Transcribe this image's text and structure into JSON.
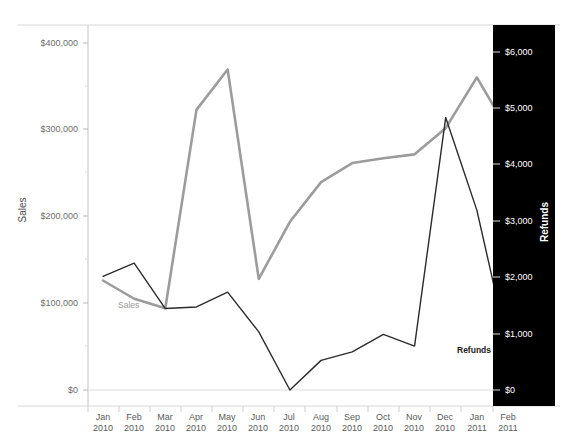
{
  "chart_data": {
    "type": "line",
    "title": "",
    "xlabel": "",
    "grid": false,
    "legend_position": "inline-annotations",
    "categories": [
      "Jan 2010",
      "Feb 2010",
      "Mar 2010",
      "Apr 2010",
      "May 2010",
      "Jun 2010",
      "Jul 2010",
      "Aug 2010",
      "Sep 2010",
      "Oct 2010",
      "Nov 2010",
      "Dec 2010",
      "Jan 2011",
      "Feb 2011"
    ],
    "categories_lines": [
      [
        "Jan",
        "2010"
      ],
      [
        "Feb",
        "2010"
      ],
      [
        "Mar",
        "2010"
      ],
      [
        "Apr",
        "2010"
      ],
      [
        "May",
        "2010"
      ],
      [
        "Jun",
        "2010"
      ],
      [
        "Jul",
        "2010"
      ],
      [
        "Aug",
        "2010"
      ],
      [
        "Sep",
        "2010"
      ],
      [
        "Oct",
        "2010"
      ],
      [
        "Nov",
        "2010"
      ],
      [
        "Dec",
        "2010"
      ],
      [
        "Jan",
        "2011"
      ],
      [
        "Feb",
        "2011"
      ]
    ],
    "series": [
      {
        "name": "Sales",
        "axis": "left",
        "color": "#9c9c9c",
        "values": [
          138000,
          115000,
          103000,
          353000,
          404000,
          140000,
          212000,
          262000,
          286000,
          292000,
          297000,
          330000,
          394000,
          327000
        ]
      },
      {
        "name": "Refunds",
        "axis": "right",
        "color": "#2b2b2b",
        "values": [
          2150,
          2400,
          1540,
          1570,
          1850,
          1100,
          0,
          560,
          720,
          1050,
          830,
          5150,
          3400,
          800
        ]
      }
    ],
    "left_axis": {
      "label": "Sales",
      "ylim": [
        0,
        460000
      ],
      "ticks": [
        0,
        100000,
        200000,
        300000,
        400000
      ],
      "tick_labels": [
        "$0",
        "$100,000",
        "$200,000",
        "$300,000",
        "$400,000"
      ],
      "minor_ticks": [
        50000,
        150000,
        250000,
        350000
      ]
    },
    "right_axis": {
      "label": "Refunds",
      "ylim": [
        0,
        6900
      ],
      "ticks": [
        0,
        1000,
        2000,
        3000,
        4000,
        5000,
        6000
      ],
      "tick_labels": [
        "$0",
        "$1,000",
        "$2,000",
        "$3,000",
        "$4,000",
        "$5,000",
        "$6,000"
      ],
      "panel_color": "#000000",
      "text_color": "#ffffff"
    },
    "annotations": [
      {
        "text": "Sales",
        "series": "Sales",
        "color": "#9a9a9a"
      },
      {
        "text": "Refunds",
        "series": "Refunds",
        "color": "#1a1a1a"
      }
    ]
  }
}
